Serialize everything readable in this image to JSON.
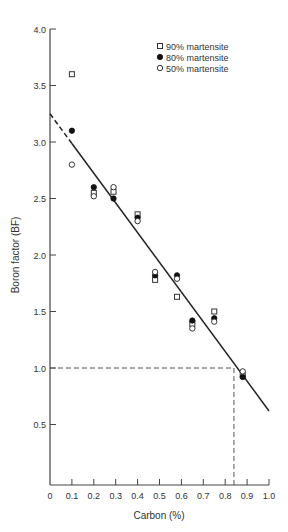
{
  "chart_data": {
    "type": "scatter",
    "title": "",
    "xlabel": "Carbon (%)",
    "ylabel": "Boron factor (BF)",
    "xlim": [
      0,
      1.0
    ],
    "ylim": [
      0,
      4.0
    ],
    "x_ticks": [
      "0",
      "0.1",
      "0.2",
      "0.3",
      "0.4",
      "0.5",
      "0.6",
      "0.7",
      "0.8",
      "0.9",
      "1.0"
    ],
    "y_ticks": [
      "0.5",
      "1.0",
      "1.5",
      "2.0",
      "2.5",
      "3.0",
      "3.5",
      "4.0"
    ],
    "grid": false,
    "legend_position": "upper right",
    "series": [
      {
        "name": "90% martensite",
        "marker": "open-square",
        "x": [
          0.1,
          0.2,
          0.29,
          0.4,
          0.48,
          0.58,
          0.65,
          0.75,
          0.88
        ],
        "y": [
          3.6,
          2.55,
          2.56,
          2.36,
          1.78,
          1.63,
          1.39,
          1.5,
          0.94
        ]
      },
      {
        "name": "80% martensite",
        "marker": "filled-circle",
        "x": [
          0.1,
          0.2,
          0.29,
          0.4,
          0.48,
          0.58,
          0.65,
          0.75,
          0.88
        ],
        "y": [
          3.1,
          2.6,
          2.5,
          2.33,
          1.82,
          1.82,
          1.42,
          1.44,
          0.92
        ]
      },
      {
        "name": "50% martensite",
        "marker": "open-circle",
        "x": [
          0.1,
          0.2,
          0.29,
          0.4,
          0.48,
          0.58,
          0.65,
          0.75,
          0.88
        ],
        "y": [
          2.8,
          2.52,
          2.6,
          2.3,
          1.85,
          1.79,
          1.35,
          1.41,
          0.97
        ]
      }
    ],
    "fit_line": {
      "x0": 0,
      "y0": 3.25,
      "x1": 1.0,
      "y1": 0.62,
      "dashed_until_x": 0.1
    },
    "annotations": [
      {
        "type": "dashed-guide",
        "description": "horizontal at BF=1.0 from x=0 to x=0.84"
      },
      {
        "type": "dashed-guide",
        "description": "vertical at Carbon=0.84 from BF=0 to BF=1.0"
      }
    ]
  }
}
